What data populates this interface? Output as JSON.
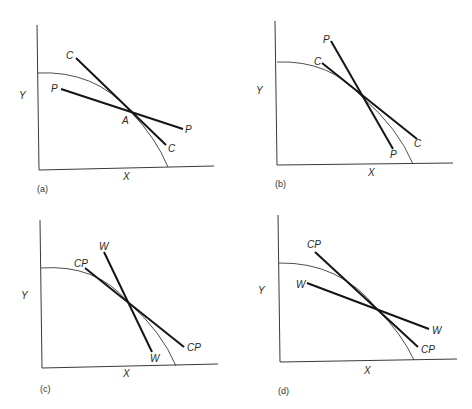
{
  "figure": {
    "panels": [
      {
        "caption": "(a)",
        "y_axis_label": "Y",
        "x_axis_label": "X",
        "lines": [
          {
            "name": "C",
            "label_start": "C",
            "label_end": "C"
          },
          {
            "name": "P",
            "label_start": "P",
            "label_end": "P"
          }
        ],
        "point_label": "A"
      },
      {
        "caption": "(b)",
        "y_axis_label": "Y",
        "x_axis_label": "X",
        "lines": [
          {
            "name": "P",
            "label_start": "P",
            "label_end": "P"
          },
          {
            "name": "C",
            "label_start": "C",
            "label_end": "C"
          }
        ]
      },
      {
        "caption": "(c)",
        "y_axis_label": "Y",
        "x_axis_label": "X",
        "lines": [
          {
            "name": "W",
            "label_start": "W",
            "label_end": "W"
          },
          {
            "name": "CP",
            "label_start": "CP",
            "label_end": "CP"
          }
        ]
      },
      {
        "caption": "(d)",
        "y_axis_label": "Y",
        "x_axis_label": "X",
        "lines": [
          {
            "name": "CP",
            "label_start": "CP",
            "label_end": "CP"
          },
          {
            "name": "W",
            "label_start": "W",
            "label_end": "W"
          }
        ]
      }
    ]
  },
  "colors": {
    "line": "#151515",
    "axis": "#3a3a3a",
    "background": "#ffffff"
  }
}
